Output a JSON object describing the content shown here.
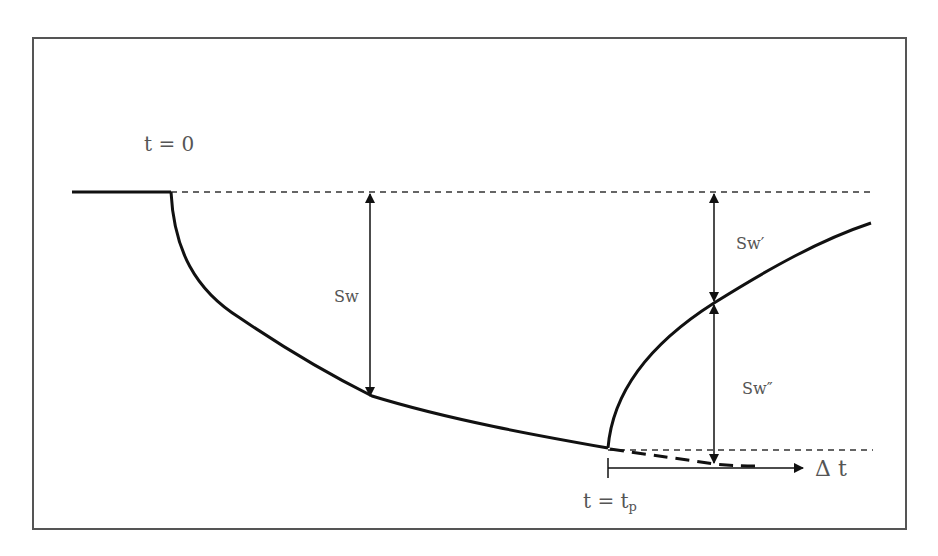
{
  "diagram": {
    "type": "drawdown-recovery-diagram",
    "labels": {
      "t_zero": "t = 0",
      "sw": "Sw",
      "sw_prime": "Sw′",
      "sw_double_prime": "Sw″",
      "t_equals": "t = t",
      "t_sub": "p",
      "delta_t": "Δ t"
    },
    "colors": {
      "line": "#111111",
      "text": "#555555",
      "frame": "#555555",
      "background": "#ffffff"
    }
  }
}
